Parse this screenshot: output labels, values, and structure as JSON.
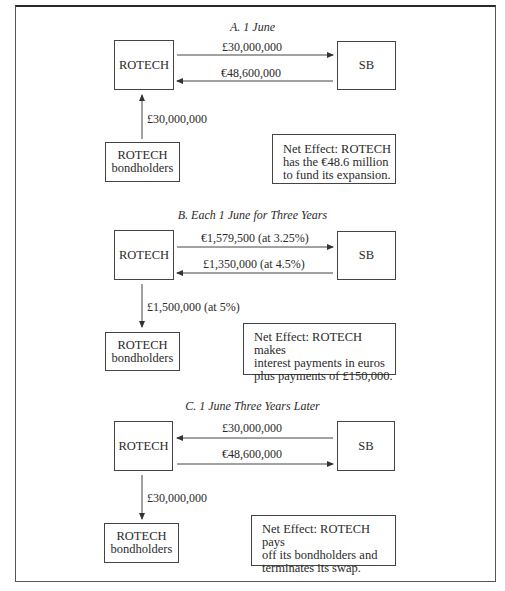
{
  "diagram": {
    "sections": [
      {
        "title": "A. 1 June",
        "left_entity": "ROTECH",
        "right_entity": "SB",
        "top_flow": {
          "label": "£30,000,000",
          "direction": "ROTECH→SB"
        },
        "bottom_flow": {
          "label": "€48,600,000",
          "direction": "SB→ROTECH"
        },
        "vertical_flow": {
          "label": "£30,000,000",
          "direction": "bondholders→ROTECH"
        },
        "bondholders": {
          "line1": "ROTECH",
          "line2": "bondholders"
        },
        "net_effect": {
          "line1": "Net Effect: ROTECH",
          "line2": "has the €48.6 million",
          "line3": "to fund its expansion."
        }
      },
      {
        "title": "B. Each 1 June for Three Years",
        "left_entity": "ROTECH",
        "right_entity": "SB",
        "top_flow": {
          "label": "€1,579,500 (at 3.25%)",
          "direction": "ROTECH→SB"
        },
        "bottom_flow": {
          "label": "£1,350,000 (at 4.5%)",
          "direction": "SB→ROTECH"
        },
        "vertical_flow": {
          "label": "£1,500,000 (at 5%)",
          "direction": "ROTECH→bondholders"
        },
        "bondholders": {
          "line1": "ROTECH",
          "line2": "bondholders"
        },
        "net_effect": {
          "line1": "Net Effect: ROTECH makes",
          "line2": "interest payments in euros",
          "line3": "plus payments of £150,000."
        }
      },
      {
        "title": "C. 1 June Three Years Later",
        "left_entity": "ROTECH",
        "right_entity": "SB",
        "top_flow": {
          "label": "£30,000,000",
          "direction": "SB→ROTECH"
        },
        "bottom_flow": {
          "label": "€48,600,000",
          "direction": "ROTECH→SB"
        },
        "vertical_flow": {
          "label": "£30,000,000",
          "direction": "ROTECH→bondholders"
        },
        "bondholders": {
          "line1": "ROTECH",
          "line2": "bondholders"
        },
        "net_effect": {
          "line1": "Net Effect: ROTECH pays",
          "line2": "off its bondholders and",
          "line3": "terminates its swap."
        }
      }
    ]
  }
}
